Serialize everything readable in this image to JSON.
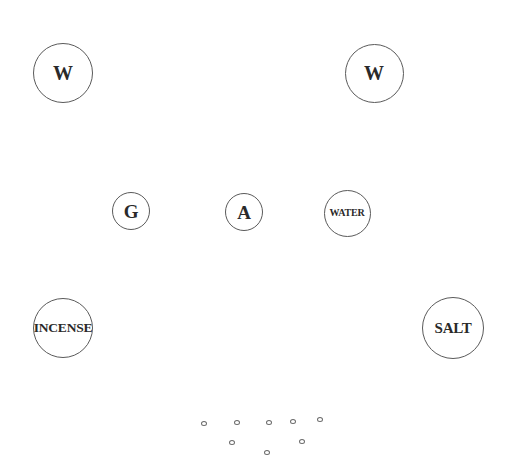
{
  "diagram": {
    "background": "#ffffff",
    "stroke_color": "#5a5a5a",
    "text_color": "#2a2a2a",
    "nodes": [
      {
        "id": "w-left",
        "label": "W",
        "cx": 63,
        "cy": 73,
        "r": 30,
        "font_size": 20
      },
      {
        "id": "w-right",
        "label": "W",
        "cx": 374,
        "cy": 73,
        "r": 29.5,
        "font_size": 20
      },
      {
        "id": "g",
        "label": "G",
        "cx": 131,
        "cy": 211,
        "r": 19,
        "font_size": 19
      },
      {
        "id": "a",
        "label": "A",
        "cx": 244,
        "cy": 212,
        "r": 19,
        "font_size": 19
      },
      {
        "id": "water",
        "label": "WATER",
        "cx": 347,
        "cy": 213,
        "r": 23.5,
        "font_size": 10
      },
      {
        "id": "incense",
        "label": "INCENSE",
        "cx": 63,
        "cy": 328,
        "r": 30,
        "font_size": 13.5
      },
      {
        "id": "salt",
        "label": "SALT",
        "cx": 453,
        "cy": 328,
        "r": 31,
        "font_size": 15
      }
    ],
    "small_circles": [
      {
        "cx": 204,
        "cy": 423
      },
      {
        "cx": 237,
        "cy": 422
      },
      {
        "cx": 269,
        "cy": 422
      },
      {
        "cx": 293,
        "cy": 421
      },
      {
        "cx": 320,
        "cy": 419
      },
      {
        "cx": 232,
        "cy": 442
      },
      {
        "cx": 302,
        "cy": 441
      },
      {
        "cx": 267,
        "cy": 452
      }
    ]
  }
}
